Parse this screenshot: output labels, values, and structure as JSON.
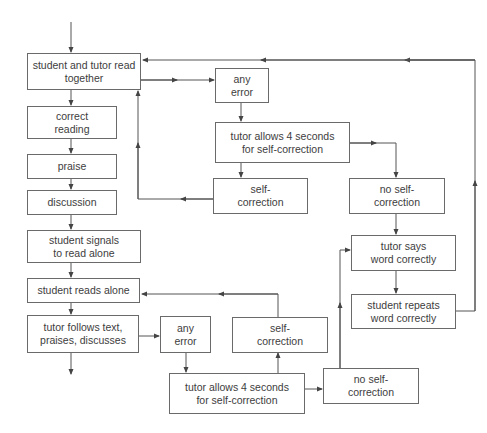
{
  "diagram": {
    "type": "flowchart",
    "nodes": {
      "read_together": "student and tutor read together",
      "correct_reading": "correct reading",
      "praise": "praise",
      "discussion": "discussion",
      "signals": "student signals to read alone",
      "reads_alone": "student reads alone",
      "follows_text": "tutor follows text, praises, discusses",
      "any_error_1": "any error",
      "wait_1": "tutor allows 4 seconds for self-correction",
      "self_corr_1": "self-correction",
      "no_self_corr_1": "no self-correction",
      "says_word": "tutor says word correctly",
      "repeats_word": "student repeats word correctly",
      "any_error_2": "any error",
      "wait_2": "tutor allows 4 seconds for self-correction",
      "self_corr_2": "self-correction",
      "no_self_corr_2": "no self-correction"
    },
    "edges": [
      [
        "start",
        "read_together"
      ],
      [
        "read_together",
        "correct_reading"
      ],
      [
        "correct_reading",
        "praise"
      ],
      [
        "praise",
        "discussion"
      ],
      [
        "discussion",
        "signals"
      ],
      [
        "signals",
        "reads_alone"
      ],
      [
        "reads_alone",
        "follows_text"
      ],
      [
        "follows_text",
        "end"
      ],
      [
        "read_together",
        "any_error_1"
      ],
      [
        "any_error_1",
        "wait_1"
      ],
      [
        "wait_1",
        "self_corr_1"
      ],
      [
        "wait_1",
        "no_self_corr_1"
      ],
      [
        "self_corr_1",
        "read_together"
      ],
      [
        "no_self_corr_1",
        "says_word"
      ],
      [
        "says_word",
        "repeats_word"
      ],
      [
        "repeats_word",
        "read_together"
      ],
      [
        "follows_text",
        "any_error_2"
      ],
      [
        "any_error_2",
        "wait_2"
      ],
      [
        "wait_2",
        "self_corr_2"
      ],
      [
        "wait_2",
        "no_self_corr_2"
      ],
      [
        "self_corr_2",
        "reads_alone"
      ],
      [
        "no_self_corr_2",
        "says_word"
      ]
    ]
  }
}
